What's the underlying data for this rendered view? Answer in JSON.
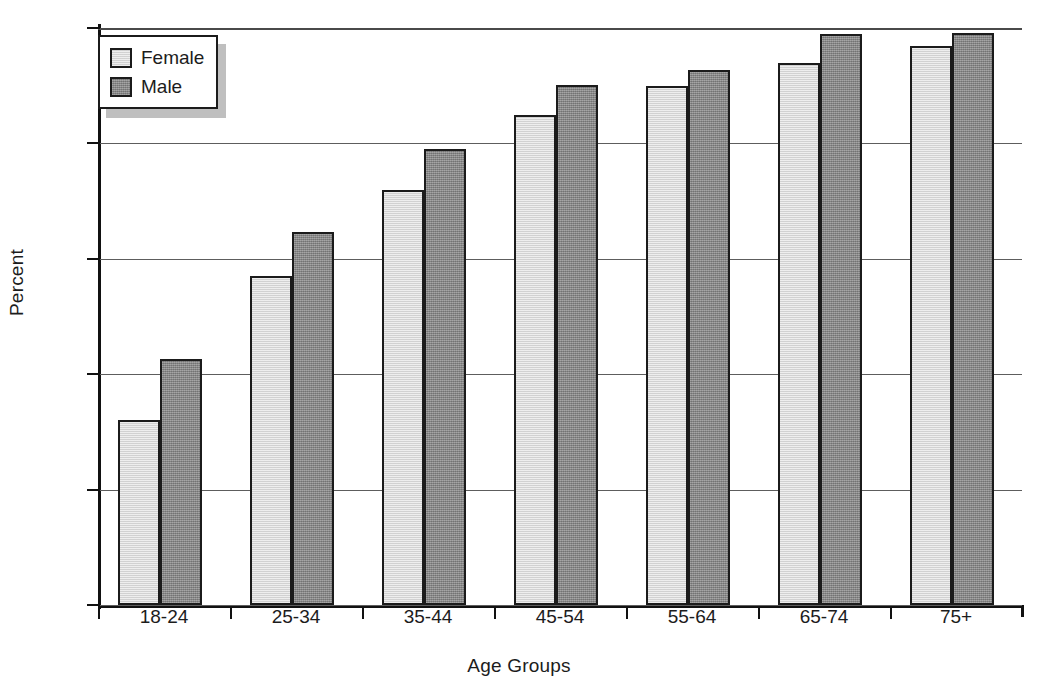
{
  "chart_data": {
    "type": "bar",
    "title": "",
    "xlabel": "Age Groups",
    "ylabel": "Percent",
    "categories": [
      "18-24",
      "25-34",
      "35-44",
      "45-54",
      "55-64",
      "65-74",
      "75+"
    ],
    "series": [
      {
        "name": "Female",
        "color": "#d9d9d9",
        "values": [
          32,
          57,
          72,
          85,
          90,
          94,
          96.8
        ]
      },
      {
        "name": "Male",
        "color": "#888888",
        "values": [
          42.7,
          64.7,
          79,
          90.2,
          92.8,
          99,
          99.2
        ]
      }
    ],
    "ylim": [
      0,
      100
    ],
    "yticks": [
      0,
      20,
      40,
      60,
      80,
      100
    ],
    "ytick_labels": [
      "0",
      "20",
      "40",
      "60",
      "80",
      "100"
    ],
    "grid": "horizontal",
    "legend_position": "top-left",
    "legend_entries": [
      "Female",
      "Male"
    ]
  },
  "axis": {
    "y_title": "Percent",
    "x_title": "Age Groups"
  },
  "legend": {
    "items": [
      {
        "label": "Female"
      },
      {
        "label": "Male"
      }
    ]
  }
}
